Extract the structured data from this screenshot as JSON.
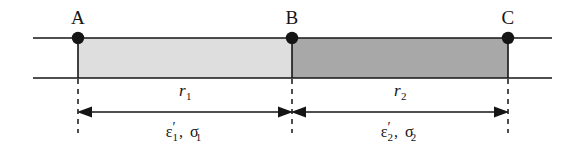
{
  "figure": {
    "type": "physics-diagram",
    "background_color": "#ffffff",
    "line_color": "#151515",
    "canvas": {
      "width": 584,
      "height": 152
    }
  },
  "geometry": {
    "top_line_y": 38,
    "bottom_line_y": 78,
    "line_x_start": 33,
    "line_x_end": 552,
    "arrow_line_y": 112,
    "dash_bottom_y": 132,
    "node_radius": 6
  },
  "nodes": [
    {
      "id": "A",
      "label": "A",
      "x": 78,
      "y": 38,
      "label_y": 8
    },
    {
      "id": "B",
      "label": "B",
      "x": 292,
      "y": 38,
      "label_y": 8
    },
    {
      "id": "C",
      "label": "C",
      "x": 508,
      "y": 38,
      "label_y": 8
    }
  ],
  "bands": [
    {
      "id": "band-1",
      "from": "A",
      "to": "B",
      "x": 78,
      "width": 214,
      "fill": "#dedede",
      "name": "inner-layer"
    },
    {
      "id": "band-2",
      "from": "B",
      "to": "C",
      "x": 292,
      "width": 216,
      "fill": "#a8a8a8",
      "name": "outer-layer"
    }
  ],
  "dimensions": [
    {
      "id": "r1",
      "symbol": "r",
      "subscript": "1",
      "from_x": 78,
      "to_x": 292,
      "center_x": 185,
      "label_y": 82
    },
    {
      "id": "r2",
      "symbol": "r",
      "subscript": "2",
      "from_x": 292,
      "to_x": 508,
      "center_x": 400,
      "label_y": 82
    }
  ],
  "material_labels": [
    {
      "id": "mat-1",
      "epsilon": "ε",
      "prime": "′",
      "epsilon_sub": "1",
      "comma": ",",
      "sigma": "σ",
      "sigma_sub": "1",
      "text": "ε′1, σ1",
      "center_x": 185,
      "label_y": 124
    },
    {
      "id": "mat-2",
      "epsilon": "ε",
      "prime": "′",
      "epsilon_sub": "2",
      "comma": ",",
      "sigma": "σ",
      "sigma_sub": "2",
      "text": "ε′2, σ2",
      "center_x": 400,
      "label_y": 124
    }
  ],
  "colors": {
    "band_light": "#dedede",
    "band_dark": "#a8a8a8",
    "stroke": "#151515",
    "background": "#ffffff"
  }
}
